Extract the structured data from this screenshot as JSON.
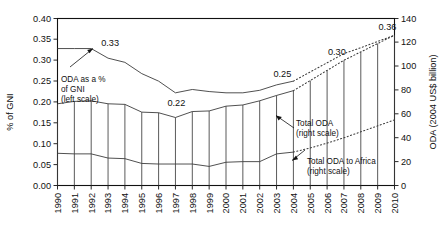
{
  "chart_data": {
    "type": "line",
    "title": "",
    "xlabel": "",
    "ylabel": "% of GNI",
    "y2label": "ODA (2004 US$ billion)",
    "grid": false,
    "legend_position": "inline-annotations",
    "x": [
      1990,
      1991,
      1992,
      1993,
      1994,
      1995,
      1996,
      1997,
      1998,
      1999,
      2000,
      2001,
      2002,
      2003,
      2004,
      2005,
      2006,
      2007,
      2008,
      2009,
      2010
    ],
    "xtick_labels": [
      "1990",
      "1991",
      "1992",
      "1993",
      "1994",
      "1995",
      "1996",
      "1997",
      "1998",
      "1999",
      "2000",
      "2001",
      "2002",
      "2003",
      "2004",
      "2005",
      "2006",
      "2007",
      "2008",
      "2009",
      "2010"
    ],
    "ylim": [
      0.0,
      0.4
    ],
    "ytick_labels": [
      "0.00",
      "0.05",
      "0.10",
      "0.15",
      "0.20",
      "0.25",
      "0.30",
      "0.35",
      "0.40"
    ],
    "ytick_values": [
      0.0,
      0.05,
      0.1,
      0.15,
      0.2,
      0.25,
      0.3,
      0.35,
      0.4
    ],
    "y2lim": [
      0,
      140
    ],
    "y2tick_labels": [
      "0",
      "20",
      "40",
      "60",
      "80",
      "100",
      "120",
      "140"
    ],
    "y2tick_values": [
      0,
      20,
      40,
      60,
      80,
      100,
      120,
      140
    ],
    "series": [
      {
        "name": "ODA as a % of GNI (left scale)",
        "axis": "left",
        "style": "solid",
        "values": [
          0.328,
          0.328,
          0.328,
          0.305,
          0.295,
          0.268,
          0.25,
          0.222,
          0.23,
          0.225,
          0.222,
          0.222,
          0.228,
          0.241,
          0.25,
          null,
          null,
          null,
          null,
          null,
          null
        ]
      },
      {
        "name": "ODA as a % of GNI (projection)",
        "axis": "left",
        "style": "dotted",
        "values": [
          null,
          null,
          null,
          null,
          null,
          null,
          null,
          null,
          null,
          null,
          null,
          null,
          null,
          null,
          0.25,
          0.272,
          0.294,
          0.316,
          0.33,
          0.345,
          0.36
        ]
      },
      {
        "name": "Total ODA (right scale)",
        "axis": "right",
        "style": "solid",
        "values": [
          68.5,
          70.5,
          71.0,
          68.5,
          68.0,
          61.5,
          61.0,
          57.0,
          62.0,
          62.5,
          66.5,
          67.5,
          71.0,
          75.5,
          79.5,
          null,
          null,
          null,
          null,
          null,
          null
        ]
      },
      {
        "name": "Total ODA (right scale, projection)",
        "axis": "right",
        "style": "dotted",
        "values": [
          null,
          null,
          null,
          null,
          null,
          null,
          null,
          null,
          null,
          null,
          null,
          null,
          null,
          null,
          79.5,
          88.0,
          96.5,
          105.0,
          112.0,
          119.0,
          126.0
        ]
      },
      {
        "name": "Total ODA to Africa (right scale)",
        "axis": "right",
        "style": "solid",
        "values": [
          27.0,
          26.5,
          26.5,
          23.0,
          22.5,
          18.5,
          18.0,
          18.0,
          18.0,
          16.0,
          19.5,
          20.0,
          20.0,
          26.5,
          28.0,
          null,
          null,
          null,
          null,
          null,
          null
        ]
      },
      {
        "name": "Total ODA to Africa (right scale, projection)",
        "axis": "right",
        "style": "dotted",
        "values": [
          null,
          null,
          null,
          null,
          null,
          null,
          null,
          null,
          null,
          null,
          null,
          null,
          null,
          null,
          28.0,
          31.5,
          35.5,
          40.0,
          45.0,
          50.0,
          55.0
        ]
      }
    ],
    "value_labels": [
      {
        "text": "0.33",
        "year": 1992,
        "value": 0.33
      },
      {
        "text": "0.22",
        "year": 1997,
        "value": 0.22
      },
      {
        "text": "0.25",
        "year": 2004,
        "value": 0.25
      },
      {
        "text": "0.30",
        "year": 2007,
        "value": 0.3
      },
      {
        "text": "0.36",
        "year": 2010,
        "value": 0.36
      }
    ],
    "annotations": [
      {
        "name": "oda-pct-gni-annotation",
        "lines": [
          "ODA as a %",
          "of GNI",
          "(left scale)"
        ]
      },
      {
        "name": "total-oda-annotation",
        "lines": [
          "Total ODA",
          "(right scale)"
        ]
      },
      {
        "name": "total-oda-africa-annotation",
        "lines": [
          "Total ODA to Africa",
          "(right scale)"
        ]
      }
    ]
  }
}
